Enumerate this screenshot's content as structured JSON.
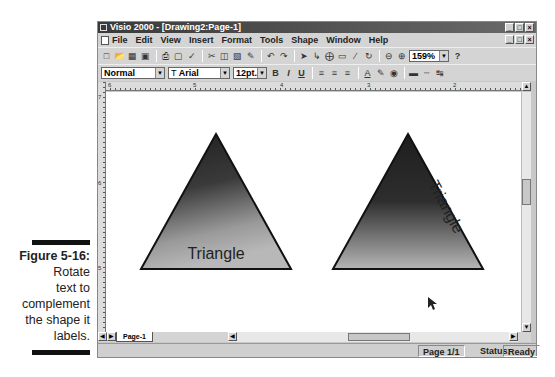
{
  "caption": {
    "figure": "Figure 5-16:",
    "lines": [
      "Rotate",
      "text to",
      "complement",
      "the shape it",
      "labels."
    ]
  },
  "window": {
    "title": "Visio 2000 - [Drawing2:Page-1]",
    "controls": [
      "_",
      "□",
      "×"
    ]
  },
  "menubar": {
    "items": [
      "File",
      "Edit",
      "View",
      "Insert",
      "Format",
      "Tools",
      "Shape",
      "Window",
      "Help"
    ]
  },
  "toolbar": {
    "zoom_value": "159%",
    "help": "?"
  },
  "format_toolbar": {
    "style_value": "Normal",
    "font_value": "Arial",
    "size_value": "12pt.",
    "bold": "B",
    "italic": "I",
    "underline": "U"
  },
  "ruler": {
    "h_labels": [
      "6",
      "5",
      "4",
      "3",
      "2"
    ],
    "v_labels": [
      "7",
      "6",
      "5"
    ]
  },
  "canvas": {
    "shapes": [
      {
        "type": "triangle",
        "label": "Triangle",
        "label_rotation": 0
      },
      {
        "type": "triangle",
        "label": "Triangle",
        "label_rotation": 62
      }
    ]
  },
  "page_tabs": {
    "active": "Page-1"
  },
  "statusbar": {
    "page": "Page 1/1",
    "status_label": "Status:",
    "status_value": "Ready"
  }
}
